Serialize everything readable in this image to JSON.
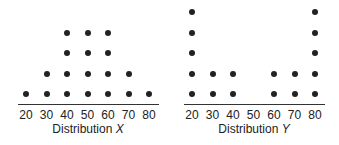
{
  "chart_data": [
    {
      "type": "dot",
      "title": "Distribution X",
      "title_prefix": "Distribution",
      "title_var": "X",
      "xlabel": "Distribution X",
      "ylabel": "",
      "categories": [
        20,
        30,
        40,
        50,
        60,
        70,
        80
      ],
      "values": [
        1,
        2,
        4,
        4,
        4,
        2,
        1
      ],
      "grid": false
    },
    {
      "type": "dot",
      "title": "Distribution Y",
      "title_prefix": "Distribution",
      "title_var": "Y",
      "xlabel": "Distribution Y",
      "ylabel": "",
      "categories": [
        20,
        30,
        40,
        50,
        60,
        70,
        80
      ],
      "values": [
        5,
        2,
        2,
        0,
        2,
        2,
        5
      ],
      "grid": false
    }
  ],
  "tick_labels": [
    "20",
    "30",
    "40",
    "50",
    "60",
    "70",
    "80"
  ],
  "colors": {
    "dot": "#222222",
    "axis": "#333333"
  }
}
